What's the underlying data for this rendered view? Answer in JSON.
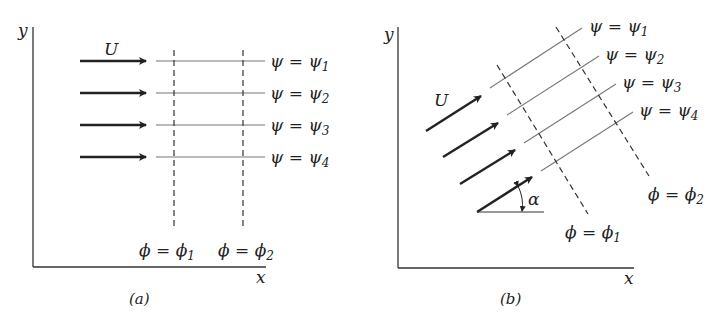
{
  "figure": {
    "panel_a": {
      "caption": "(a)",
      "axis_x": "x",
      "axis_y": "y",
      "velocity_label": "U",
      "streamlines": [
        {
          "label": "ψ = ψ",
          "sub": "1"
        },
        {
          "label": "ψ = ψ",
          "sub": "2"
        },
        {
          "label": "ψ = ψ",
          "sub": "3"
        },
        {
          "label": "ψ = ψ",
          "sub": "4"
        }
      ],
      "potential_lines": [
        {
          "label": "ϕ = ϕ",
          "sub": "1"
        },
        {
          "label": "ϕ = ϕ",
          "sub": "2"
        }
      ]
    },
    "panel_b": {
      "caption": "(b)",
      "axis_x": "x",
      "axis_y": "y",
      "velocity_label": "U",
      "angle_label": "α",
      "streamlines": [
        {
          "label": "ψ = ψ",
          "sub": "1"
        },
        {
          "label": "ψ = ψ",
          "sub": "2"
        },
        {
          "label": "ψ = ψ",
          "sub": "3"
        },
        {
          "label": "ψ = ψ",
          "sub": "4"
        }
      ],
      "potential_lines": [
        {
          "label": "ϕ = ϕ",
          "sub": "1"
        },
        {
          "label": "ϕ = ϕ",
          "sub": "2"
        }
      ]
    }
  }
}
